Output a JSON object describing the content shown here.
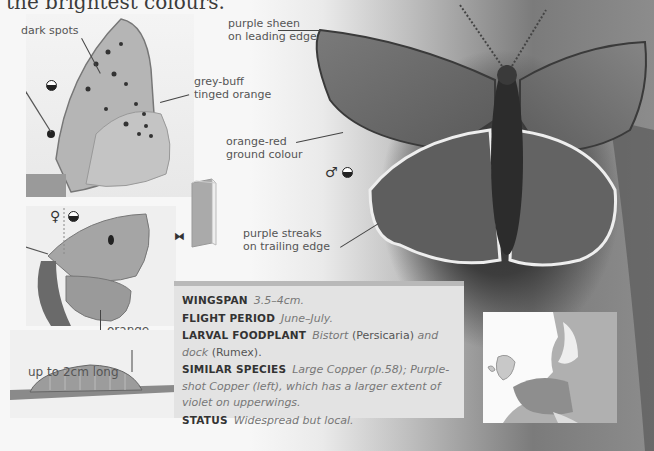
{
  "page": {
    "heading_fragment": "the brightest colours."
  },
  "underside_panel": {
    "labels": {
      "dark_spots": "dark spots",
      "grey_buff": [
        "grey-buff",
        "tinged orange"
      ]
    },
    "view_symbol": "underside"
  },
  "female_panel": {
    "sex_symbol": "♀",
    "view_symbol": "upperside",
    "labels": {
      "orange_band": [
        "orange",
        "band"
      ]
    }
  },
  "caterpillar_panel": {
    "label": "up to 2cm long"
  },
  "main_photo": {
    "sex_symbol": "♂",
    "view_symbol": "upperside",
    "labels": {
      "purple_sheen": [
        "purple sheen",
        "on leading edge"
      ],
      "orange_red": [
        "orange-red",
        "ground colour"
      ],
      "purple_streaks": [
        "purple streaks",
        "on trailing edge"
      ]
    }
  },
  "icons": {
    "book": "book-icon",
    "butterfly": "butterfly-icon"
  },
  "info_box": {
    "rows": [
      {
        "key": "WINGSPAN",
        "value": "3.5–4cm."
      },
      {
        "key": "FLIGHT PERIOD",
        "value": "June–July."
      },
      {
        "key": "LARVAL FOODPLANT",
        "parts": [
          "Bistort",
          " (Persicaria) ",
          "and",
          " dock",
          " (Rumex)."
        ]
      },
      {
        "key": "SIMILAR SPECIES",
        "value": "Large Copper (p.58); Purple-shot Copper (left), which has a larger extent of violet on upperwings."
      },
      {
        "key": "STATUS",
        "value": "Widespread but local."
      }
    ]
  },
  "map": {
    "title": "distribution-map-europe"
  }
}
